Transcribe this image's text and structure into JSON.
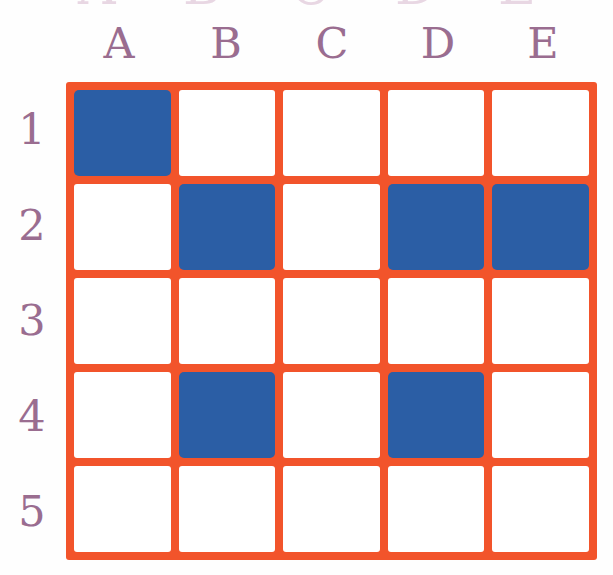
{
  "worksheet": {
    "type": "coordinate-grid",
    "columns": [
      "A",
      "B",
      "C",
      "D",
      "E"
    ],
    "rows": [
      "1",
      "2",
      "3",
      "4",
      "5"
    ],
    "colors": {
      "grid_line": "#f2542b",
      "filled_cell": "#2b5ea5",
      "empty_cell": "#ffffff",
      "label_text": "#9a6d90",
      "background": "#fefefe"
    },
    "filled_cells": [
      "A1",
      "B2",
      "D2",
      "E2",
      "B4",
      "D4"
    ],
    "cell_states": [
      [
        "filled",
        "empty",
        "empty",
        "empty",
        "empty"
      ],
      [
        "empty",
        "filled",
        "empty",
        "filled",
        "filled"
      ],
      [
        "empty",
        "empty",
        "empty",
        "empty",
        "empty"
      ],
      [
        "empty",
        "filled",
        "empty",
        "filled",
        "empty"
      ],
      [
        "empty",
        "empty",
        "empty",
        "empty",
        "empty"
      ]
    ],
    "clipped_top_text": "· · ·  ·   ·    ·     ·"
  },
  "chart_data": {
    "type": "heatmap",
    "title": "",
    "xlabel": "",
    "ylabel": "",
    "categories": [
      "A",
      "B",
      "C",
      "D",
      "E"
    ],
    "rows": [
      "1",
      "2",
      "3",
      "4",
      "5"
    ],
    "legend": [],
    "grid": true,
    "values": [
      [
        1,
        0,
        0,
        0,
        0
      ],
      [
        0,
        1,
        0,
        1,
        1
      ],
      [
        0,
        0,
        0,
        0,
        0
      ],
      [
        0,
        1,
        0,
        1,
        0
      ],
      [
        0,
        0,
        0,
        0,
        0
      ]
    ],
    "value_colors": {
      "0": "#ffffff",
      "1": "#2b5ea5"
    },
    "filled_count": 6,
    "total_cells": 25
  }
}
